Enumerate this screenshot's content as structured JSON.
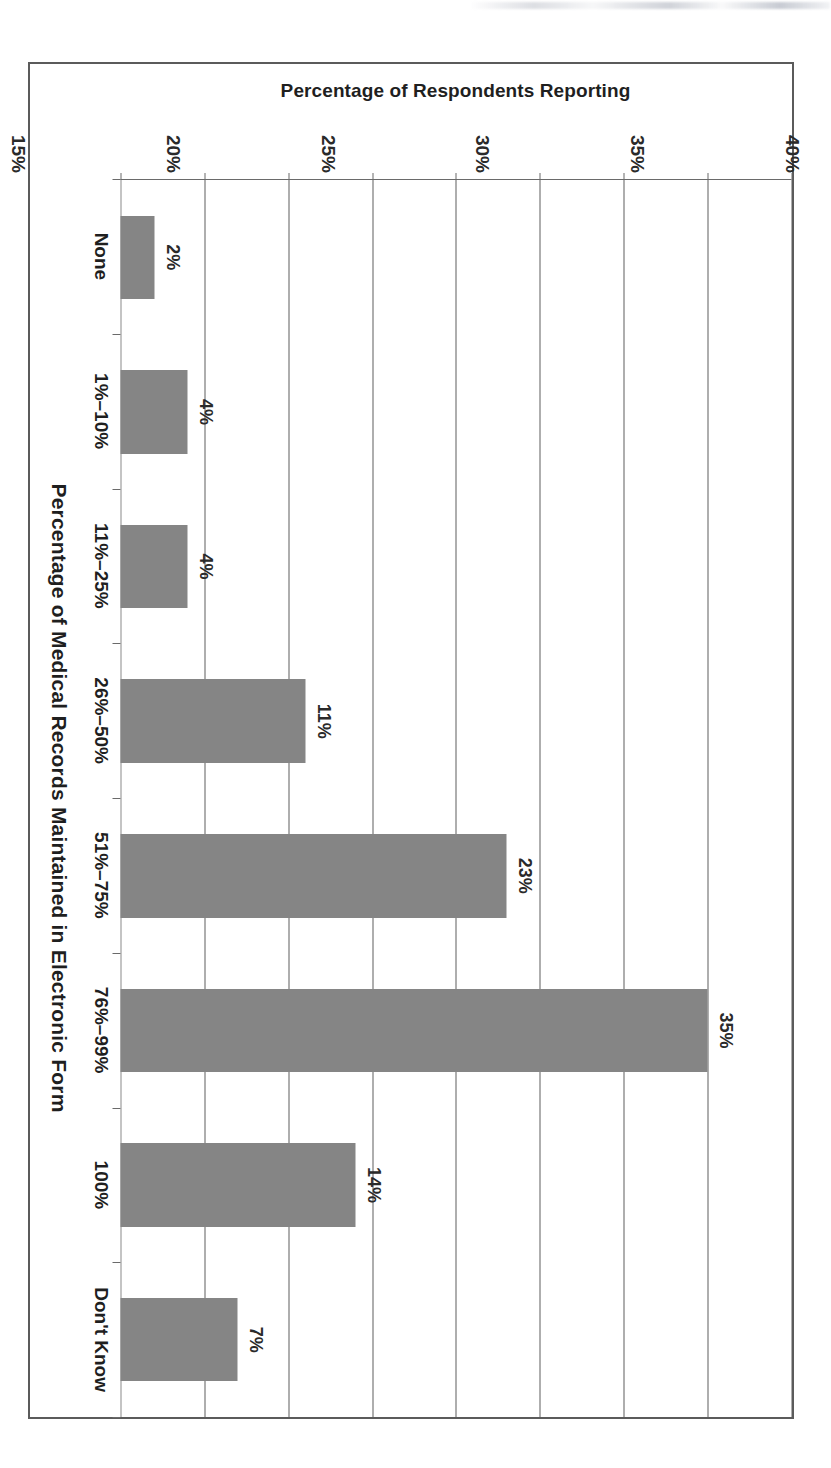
{
  "page": {
    "background_color": "#ffffff",
    "frame_color": "#5b5b5b"
  },
  "chart_data": {
    "type": "bar",
    "title": "",
    "orientation": "vertical-bars-printed-sideways",
    "rotation_degrees": 90,
    "xlabel": "Percentage of Medical Records Maintained in Electronic Form",
    "ylabel": "Percentage of Respondents Reporting",
    "categories": [
      "None",
      "1%–10%",
      "11%–25%",
      "26%–50%",
      "51%–75%",
      "76%–99%",
      "100%",
      "Don't Know"
    ],
    "values": [
      2,
      4,
      4,
      11,
      23,
      35,
      14,
      7
    ],
    "data_labels": [
      "2%",
      "4%",
      "4%",
      "11%",
      "23%",
      "35%",
      "14%",
      "7%"
    ],
    "ylim": [
      0,
      40
    ],
    "yticks": [
      0,
      5,
      10,
      15,
      20,
      25,
      30,
      35,
      40
    ],
    "ytick_labels": [
      "0%",
      "5%",
      "10%",
      "15%",
      "20%",
      "25%",
      "30%",
      "35%",
      "40%"
    ],
    "grid": true,
    "legend": null,
    "bar_color": "#858585",
    "axis_color": "#5e5e5e",
    "text_color": "#1f1f1f"
  }
}
